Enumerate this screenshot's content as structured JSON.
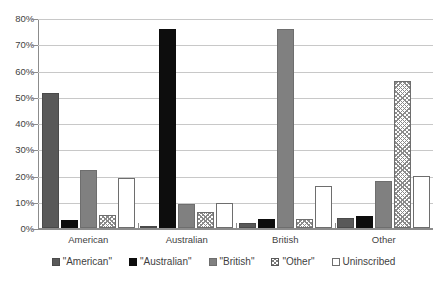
{
  "chart_data": {
    "type": "bar",
    "title": "",
    "xlabel": "",
    "ylabel": "",
    "ylim": [
      0,
      80
    ],
    "ytick_labels": [
      "80%",
      "70%",
      "60%",
      "50%",
      "40%",
      "30%",
      "20%",
      "10%",
      "0%"
    ],
    "ytick_values": [
      80,
      70,
      60,
      50,
      40,
      30,
      20,
      10,
      0
    ],
    "grid": true,
    "legend_position": "bottom",
    "categories": [
      "American",
      "Australian",
      "British",
      "Other"
    ],
    "series": [
      {
        "name": "\"American\"",
        "values": [
          51.5,
          0.5,
          2.0,
          4.0
        ],
        "color": "#595959",
        "pattern": "solid"
      },
      {
        "name": "\"Australian\"",
        "values": [
          3.0,
          76.0,
          3.5,
          4.5
        ],
        "color": "#0d0d0d",
        "pattern": "solid"
      },
      {
        "name": "\"British\"",
        "values": [
          22.0,
          9.0,
          76.0,
          18.0
        ],
        "color": "#808080",
        "pattern": "solid"
      },
      {
        "name": "\"Other\"",
        "values": [
          5.0,
          6.0,
          3.5,
          56.0
        ],
        "color": "#ffffff",
        "pattern": "checkered"
      },
      {
        "name": "Uninscribed",
        "values": [
          19.0,
          9.5,
          16.0,
          20.0
        ],
        "color": "#ffffff",
        "pattern": "solid"
      }
    ]
  }
}
